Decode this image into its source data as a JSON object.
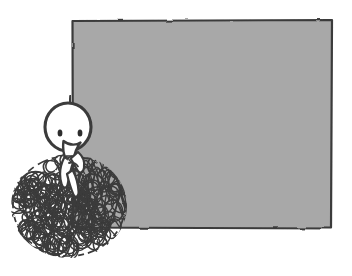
{
  "canvas": {
    "width": 352,
    "height": 276,
    "background_color": "#ffffff",
    "alt_text": "Hand-drawn doodle of a round-headed figure with a long nose sitting in front of a large blank gray rectangle, its body drawn as a dense tangled scribble ball."
  },
  "panel": {
    "name": "blank-gray-panel",
    "fill_color": "#a8a8a8",
    "stroke_color": "#3b3b3b",
    "stroke_width": 2.2,
    "x": 72,
    "y": 20,
    "width": 260,
    "height": 208,
    "label": ""
  },
  "figure": {
    "name": "doodle-figure",
    "ink_color": "#3b3b3b",
    "skin_color": "#ffffff",
    "head": {
      "center_x": 68,
      "center_y": 127,
      "radius_x": 23,
      "radius_y": 24,
      "fill": "#ffffff",
      "stroke": "#3b3b3b",
      "stroke_width": 3.1
    },
    "eyes": [
      {
        "name": "eye-left",
        "center_x": 60,
        "center_y": 133,
        "radius_x": 2.4,
        "radius_y": 3.6,
        "fill": "#2e2e2e"
      },
      {
        "name": "eye-right",
        "center_x": 80,
        "center_y": 133,
        "radius_x": 2.4,
        "radius_y": 3.6,
        "fill": "#2e2e2e"
      }
    ],
    "nose": {
      "name": "long-nose",
      "fill": "#ffffff",
      "stroke": "#3b3b3b",
      "stroke_width": 2.4,
      "tip_x": 71,
      "tip_y": 162
    },
    "antenna": {
      "name": "head-tuft",
      "x": 70,
      "y_top": 96,
      "y_bottom": 104
    },
    "arms": {
      "name": "arm-shapes",
      "fill": "#ffffff",
      "stroke": "#3b3b3b",
      "stroke_width": 2.2
    }
  },
  "scribble": {
    "name": "tangled-scribble-body",
    "stroke_color": "#3b3b3b",
    "stroke_width": 1.5,
    "center_x": 69,
    "center_y": 206,
    "radius_x": 57,
    "radius_y": 51,
    "loop_count": 150,
    "description": "dense mass of overlapping small circular loops forming a round tangled ball"
  }
}
